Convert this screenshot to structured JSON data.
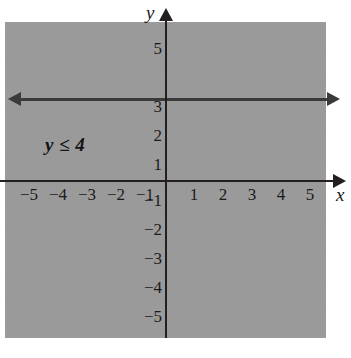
{
  "figure": {
    "kind": "coordinate-plane-inequality-graph",
    "inequality_label": "y ≤ 4",
    "axis_names": {
      "x": "x",
      "y": "y"
    }
  },
  "chart_data": {
    "type": "line",
    "title": "",
    "subtitle": "",
    "xlabel": "x",
    "ylabel": "y",
    "xlim": [
      -5.7,
      5.7
    ],
    "ylim": [
      -5.7,
      5.7
    ],
    "grid": true,
    "grid_style": "dotted",
    "grid_spacing": 1,
    "legend": "none",
    "annotations": [
      {
        "text": "y ≤ 4",
        "x": -3.5,
        "y": 1.5,
        "style": "bold-italic"
      }
    ],
    "series": [
      {
        "name": "boundary y = 4",
        "type": "line",
        "equation": "y = 4",
        "line_style": "solid",
        "inclusive": true,
        "arrows": "both",
        "x": [
          -5.7,
          5.7
        ],
        "values": [
          4,
          4
        ]
      }
    ],
    "shaded_regions": [
      {
        "name": "solution set",
        "inequality": "y ≤ 4",
        "fill": "#c9c9c9",
        "direction": "below",
        "boundary_y": 4
      }
    ],
    "xticks": [
      -5,
      -4,
      -3,
      -2,
      -1,
      1,
      2,
      3,
      4,
      5
    ],
    "xticklabels": [
      "−5",
      "−4",
      "−3",
      "−2",
      "−1",
      "1",
      "2",
      "3",
      "4",
      "5"
    ],
    "yticks": [
      -5,
      -4,
      -3,
      -2,
      -1,
      1,
      2,
      3,
      5
    ],
    "yticklabels": [
      "−5",
      "−4",
      "−3",
      "−2",
      "−1",
      "1",
      "2",
      "3",
      "5"
    ]
  },
  "ticks": {
    "x": [
      {
        "label": "−5",
        "left": 18
      },
      {
        "label": "−4",
        "left": 47
      },
      {
        "label": "−3",
        "left": 76
      },
      {
        "label": "−2",
        "left": 105
      },
      {
        "label": "−1",
        "left": 134
      },
      {
        "label": "1",
        "left": 183
      },
      {
        "label": "2",
        "left": 212
      },
      {
        "label": "3",
        "left": 241
      },
      {
        "label": "4",
        "left": 270
      },
      {
        "label": "5",
        "left": 299
      }
    ],
    "y": [
      {
        "label": "5",
        "top": 40
      },
      {
        "label": "3",
        "top": 98
      },
      {
        "label": "2",
        "top": 127
      },
      {
        "label": "1",
        "top": 156
      },
      {
        "label": "−1",
        "top": 192
      },
      {
        "label": "−2",
        "top": 221
      },
      {
        "label": "−3",
        "top": 250
      },
      {
        "label": "−4",
        "top": 279
      },
      {
        "label": "−5",
        "top": 308
      }
    ]
  },
  "gridlines": {
    "vertical": [
      0,
      29,
      58,
      87,
      116,
      145,
      174,
      203,
      232,
      261,
      290,
      319
    ],
    "horizontal": [
      0,
      26,
      55,
      84,
      113,
      142,
      171,
      200,
      229,
      258,
      287,
      315
    ]
  }
}
